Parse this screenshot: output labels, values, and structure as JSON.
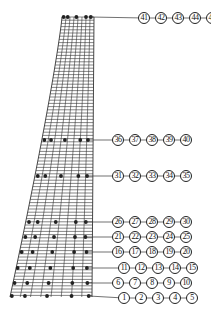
{
  "diagram": {
    "type": "finite-element mesh with monitoring points",
    "colors": {
      "mesh": "#333333",
      "node": "#222222",
      "leader": "#333333",
      "label_border": "#222222"
    },
    "mesh": {
      "top_y": 17,
      "bottom_y": 297,
      "top_left_x": 62,
      "top_right_x": 94,
      "bottom_left_x": 10,
      "bottom_right_x": 92,
      "vertical_lines": 9,
      "horizontal_spacing": 3.2
    },
    "groups": [
      {
        "labels": [
          "41",
          "42",
          "43",
          "44",
          "45"
        ],
        "mesh_y": 17,
        "label_y": 18,
        "label_x0": 144,
        "node_fracs": [
          0.05,
          0.18,
          0.45,
          0.75,
          0.9
        ]
      },
      {
        "labels": [
          "36",
          "37",
          "38",
          "39",
          "40"
        ],
        "mesh_y": 140,
        "label_y": 140,
        "label_x0": 118,
        "node_fracs": [
          0.05,
          0.18,
          0.45,
          0.75,
          0.9
        ]
      },
      {
        "labels": [
          "31",
          "32",
          "33",
          "34",
          "35"
        ],
        "mesh_y": 176,
        "label_y": 176,
        "label_x0": 118,
        "node_fracs": [
          0.05,
          0.18,
          0.45,
          0.75,
          0.9
        ]
      },
      {
        "labels": [
          "26",
          "27",
          "28",
          "29",
          "30"
        ],
        "mesh_y": 222,
        "label_y": 222,
        "label_x0": 118,
        "node_fracs": [
          0.05,
          0.18,
          0.45,
          0.75,
          0.9
        ]
      },
      {
        "labels": [
          "21",
          "22",
          "23",
          "24",
          "25"
        ],
        "mesh_y": 237,
        "label_y": 237,
        "label_x0": 118,
        "node_fracs": [
          0.04,
          0.18,
          0.45,
          0.75,
          0.9
        ]
      },
      {
        "labels": [
          "16",
          "17",
          "18",
          "19",
          "20"
        ],
        "mesh_y": 252,
        "label_y": 252,
        "label_x0": 118,
        "node_fracs": [
          0.03,
          0.18,
          0.45,
          0.75,
          0.92
        ]
      },
      {
        "labels": [
          "11",
          "12",
          "13",
          "14",
          "15"
        ],
        "mesh_y": 268,
        "label_y": 268,
        "label_x0": 124,
        "node_fracs": [
          0.02,
          0.18,
          0.45,
          0.75,
          0.93
        ]
      },
      {
        "labels": [
          "6",
          "7",
          "8",
          "9",
          "10"
        ],
        "mesh_y": 283,
        "label_y": 283,
        "label_x0": 118,
        "node_fracs": [
          0.02,
          0.18,
          0.45,
          0.75,
          0.94
        ]
      },
      {
        "labels": [
          "1",
          "2",
          "3",
          "4",
          "5"
        ],
        "mesh_y": 296,
        "label_y": 298,
        "label_x0": 124,
        "node_fracs": [
          0.02,
          0.18,
          0.45,
          0.75,
          0.96
        ]
      }
    ],
    "label_step": 17
  }
}
